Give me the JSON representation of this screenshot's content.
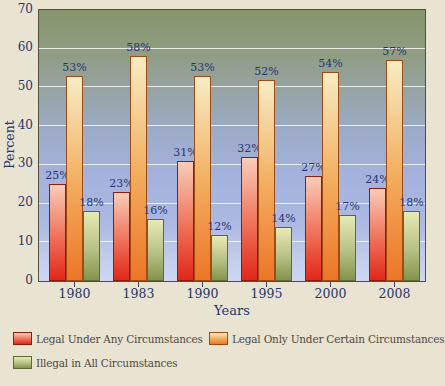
{
  "chart_data": {
    "type": "bar",
    "title": "",
    "xlabel": "Years",
    "ylabel": "Percent",
    "ylim": [
      0,
      70
    ],
    "yticks": [
      0,
      10,
      20,
      30,
      40,
      50,
      60,
      70
    ],
    "grid": true,
    "legend_position": "bottom",
    "value_label_suffix": "%",
    "categories": [
      "1980",
      "1983",
      "1990",
      "1995",
      "2000",
      "2008"
    ],
    "series": [
      {
        "name": "Legal Under Any Circumstances",
        "values": [
          25,
          23,
          31,
          32,
          27,
          24
        ],
        "color_top": "#f8ccba",
        "color_mid": "#ef7157",
        "color_bottom": "#e1271a",
        "border": "#8a1d10"
      },
      {
        "name": "Legal Only Under Certain Circumstances",
        "values": [
          53,
          58,
          53,
          52,
          54,
          57
        ],
        "color_top": "#f8ecc2",
        "color_mid": "#f2aa5a",
        "color_bottom": "#ee7526",
        "border": "#9c4a16"
      },
      {
        "name": "Illegal in All Circumstances",
        "values": [
          18,
          16,
          12,
          14,
          17,
          18
        ],
        "color_top": "#e7eab6",
        "color_mid": "#b7c183",
        "color_bottom": "#83944c",
        "border": "#5c6b33"
      }
    ],
    "plot_background_stops": [
      "#87956c 0%",
      "#8f9c80 15%",
      "#97a4a4 30%",
      "#9dabc8 45%",
      "#a4b1da 60%",
      "#abb8e2 78%",
      "#c0c9ea 90%",
      "#ced7f2 100%"
    ],
    "gridline_color": "rgba(255,255,255,0.82)"
  },
  "colors": {
    "page_background": "#e9e3d2",
    "axis_text": "#27356b",
    "legend_text": "#4d4a3f",
    "plot_border": "#544e3c",
    "tick_mark": "#4a443c"
  }
}
